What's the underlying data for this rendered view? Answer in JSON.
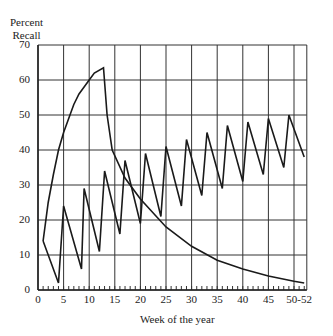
{
  "chart_data": {
    "type": "line",
    "title": "",
    "ylabel": "Percent Recall",
    "ylabel_lines": [
      "Percent",
      "Recall"
    ],
    "xlabel": "Week of the year",
    "ylim": [
      0,
      70
    ],
    "xlim": [
      0,
      52
    ],
    "grid": true,
    "y_ticks": [
      "0",
      "10",
      "20",
      "30",
      "40",
      "50",
      "60",
      "70"
    ],
    "x_ticks": [
      "0",
      "5",
      "10",
      "15",
      "20",
      "25",
      "30",
      "35",
      "40",
      "45",
      "50-52"
    ],
    "series": [
      {
        "name": "Massed exposure (weekly for 13 weeks)",
        "points": [
          [
            1,
            14
          ],
          [
            2,
            25
          ],
          [
            3,
            33
          ],
          [
            4,
            40
          ],
          [
            5,
            45
          ],
          [
            6,
            49
          ],
          [
            7,
            53
          ],
          [
            8,
            56
          ],
          [
            9,
            58
          ],
          [
            10,
            60
          ],
          [
            11,
            62
          ],
          [
            12.8,
            63.5
          ],
          [
            13.5,
            50
          ],
          [
            14.5,
            40
          ],
          [
            17,
            32
          ],
          [
            20,
            26
          ],
          [
            25,
            18
          ],
          [
            30,
            12.5
          ],
          [
            35,
            8.5
          ],
          [
            40,
            6
          ],
          [
            45,
            4
          ],
          [
            50,
            2.5
          ],
          [
            52,
            2
          ]
        ]
      },
      {
        "name": "Spaced exposure (every 4 weeks)",
        "points": [
          [
            1,
            14
          ],
          [
            4,
            2
          ],
          [
            5,
            24
          ],
          [
            8.5,
            6
          ],
          [
            9,
            29
          ],
          [
            12,
            11
          ],
          [
            13,
            34
          ],
          [
            16,
            16
          ],
          [
            17,
            37
          ],
          [
            20,
            19
          ],
          [
            21,
            39
          ],
          [
            24,
            21
          ],
          [
            25,
            41
          ],
          [
            28,
            24
          ],
          [
            29,
            43
          ],
          [
            32,
            27
          ],
          [
            33,
            45
          ],
          [
            36,
            29
          ],
          [
            37,
            47
          ],
          [
            40,
            31
          ],
          [
            41,
            48
          ],
          [
            44,
            33
          ],
          [
            45,
            49
          ],
          [
            48,
            35
          ],
          [
            49,
            50
          ],
          [
            52,
            38
          ]
        ]
      }
    ]
  }
}
